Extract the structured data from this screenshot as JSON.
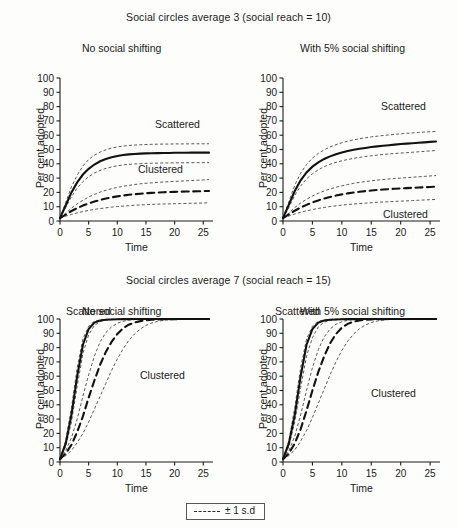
{
  "figure": {
    "sections": [
      {
        "id": "a",
        "title": "Social circles average 3 (social reach = 10)",
        "panels": [
          {
            "subtitle": "No social shifting",
            "scattered_label": "Scattered",
            "clustered_label": "Clustered"
          },
          {
            "subtitle": "With 5% social shifting",
            "scattered_label": "Scattered",
            "clustered_label": "Clustered"
          }
        ]
      },
      {
        "id": "b",
        "title": "Social circles average 7 (social reach = 15)",
        "panels": [
          {
            "subtitle": "No social shifting",
            "scattered_label": "Scattered",
            "clustered_label": "Clustered"
          },
          {
            "subtitle": "With 5% social shifting",
            "scattered_label": "Scattered",
            "clustered_label": "Clustered"
          }
        ]
      }
    ],
    "legend": {
      "label": "± 1 s.d",
      "marker": "dashed-line"
    },
    "axis": {
      "ylabel": "Per cent adopted",
      "xlabel": "Time",
      "yticks": [
        0,
        10,
        20,
        30,
        40,
        50,
        60,
        70,
        80,
        90,
        100
      ],
      "xticks": [
        0,
        5,
        10,
        15,
        20,
        25
      ],
      "ylim": [
        0,
        100
      ],
      "xlim": [
        0,
        26
      ]
    }
  },
  "chart_data": {
    "type": "line",
    "xlabel": "Time",
    "ylabel": "Per cent adopted",
    "xlim": [
      0,
      26
    ],
    "ylim": [
      0,
      100
    ],
    "grid": false,
    "legend": "bottom-center",
    "legend_entries": [
      "± 1 s.d"
    ],
    "x": [
      0,
      1,
      2,
      3,
      4,
      5,
      6,
      7,
      8,
      9,
      10,
      11,
      12,
      13,
      14,
      15,
      16,
      17,
      18,
      19,
      20,
      21,
      22,
      23,
      24,
      25,
      26
    ],
    "panels": [
      {
        "panel": "top-left",
        "section_title": "Social circles average 3 (social reach = 10)",
        "subtitle": "No social shifting",
        "series": [
          {
            "name": "Scattered mean",
            "style": "solid-thick",
            "values": [
              2,
              11,
              20,
              27,
              32.5,
              36.5,
              39.5,
              41.8,
              43.4,
              44.6,
              45.5,
              46.1,
              46.6,
              46.9,
              47.1,
              47.3,
              47.4,
              47.5,
              47.6,
              47.6,
              47.7,
              47.7,
              47.7,
              47.8,
              47.8,
              47.8,
              47.8
            ]
          },
          {
            "name": "Scattered +1 s.d",
            "style": "dotted-thin",
            "values": [
              2,
              13,
              24,
              32,
              38.5,
              43,
              46,
              48.2,
              49.8,
              51,
              51.8,
              52.4,
              52.8,
              53.1,
              53.3,
              53.5,
              53.6,
              53.7,
              53.8,
              53.8,
              53.9,
              53.9,
              53.9,
              54,
              54,
              54,
              54
            ]
          },
          {
            "name": "Scattered -1 s.d",
            "style": "dotted-thin",
            "values": [
              2,
              9.5,
              17,
              23,
              27.5,
              31,
              33.5,
              35.4,
              36.8,
              37.8,
              38.6,
              39.2,
              39.6,
              39.9,
              40.1,
              40.3,
              40.4,
              40.5,
              40.6,
              40.6,
              40.7,
              40.7,
              40.7,
              40.8,
              40.8,
              40.8,
              40.8
            ]
          },
          {
            "name": "Clustered mean",
            "style": "dashed-thick",
            "values": [
              2,
              4.5,
              7,
              9,
              10.8,
              12.3,
              13.6,
              14.7,
              15.7,
              16.5,
              17.2,
              17.8,
              18.3,
              18.7,
              19.1,
              19.4,
              19.7,
              19.9,
              20.1,
              20.3,
              20.4,
              20.5,
              20.6,
              20.7,
              20.8,
              20.9,
              21
            ]
          },
          {
            "name": "Clustered +1 s.d",
            "style": "dotted-thin",
            "values": [
              2,
              5.5,
              9,
              12,
              14.5,
              16.8,
              18.6,
              20.2,
              21.5,
              22.6,
              23.5,
              24.3,
              24.9,
              25.5,
              26,
              26.4,
              26.7,
              27,
              27.3,
              27.5,
              27.7,
              27.9,
              28.1,
              28.3,
              28.5,
              28.7,
              28.9
            ]
          },
          {
            "name": "Clustered -1 s.d",
            "style": "dotted-thin",
            "values": [
              2,
              3.4,
              4.6,
              5.7,
              6.6,
              7.4,
              8.1,
              8.7,
              9.2,
              9.7,
              10.1,
              10.4,
              10.7,
              11,
              11.2,
              11.4,
              11.6,
              11.8,
              11.9,
              12,
              12.1,
              12.2,
              12.3,
              12.4,
              12.5,
              12.6,
              12.7
            ]
          }
        ]
      },
      {
        "panel": "top-right",
        "section_title": "Social circles average 3 (social reach = 10)",
        "subtitle": "With 5% social shifting",
        "series": [
          {
            "name": "Scattered mean",
            "style": "solid-thick",
            "values": [
              2,
              11.5,
              21,
              28.5,
              34,
              38,
              41,
              43.4,
              45.2,
              46.7,
              47.9,
              48.9,
              49.8,
              50.5,
              51.1,
              51.7,
              52.2,
              52.6,
              53,
              53.4,
              53.8,
              54.1,
              54.4,
              54.7,
              55,
              55.3,
              55.6
            ]
          },
          {
            "name": "Scattered +1 s.d",
            "style": "dotted-thin",
            "values": [
              2,
              13.5,
              25,
              33.5,
              39.5,
              44,
              47.3,
              49.8,
              51.8,
              53.4,
              54.7,
              55.8,
              56.7,
              57.5,
              58.2,
              58.8,
              59.3,
              59.8,
              60.2,
              60.6,
              61,
              61.3,
              61.6,
              61.9,
              62.2,
              62.4,
              62.6
            ]
          },
          {
            "name": "Scattered -1 s.d",
            "style": "dotted-thin",
            "values": [
              2,
              9.5,
              18,
              24.5,
              29.5,
              33,
              35.8,
              38,
              39.7,
              41,
              42.1,
              43,
              43.8,
              44.5,
              45.1,
              45.6,
              46.1,
              46.5,
              46.9,
              47.2,
              47.5,
              47.8,
              48.1,
              48.4,
              48.7,
              49,
              49.3
            ]
          },
          {
            "name": "Clustered mean",
            "style": "dashed-thick",
            "values": [
              2,
              4.6,
              7.2,
              9.4,
              11.3,
              13,
              14.4,
              15.7,
              16.8,
              17.8,
              18.6,
              19.3,
              19.9,
              20.4,
              20.9,
              21.3,
              21.7,
              22,
              22.3,
              22.6,
              22.8,
              23,
              23.2,
              23.4,
              23.6,
              23.8,
              24
            ]
          },
          {
            "name": "Clustered +1 s.d",
            "style": "dotted-thin",
            "values": [
              2,
              5.6,
              9.4,
              12.6,
              15.2,
              17.5,
              19.4,
              21,
              22.4,
              23.6,
              24.6,
              25.5,
              26.3,
              27,
              27.6,
              28.1,
              28.6,
              29,
              29.4,
              29.7,
              30,
              30.3,
              30.6,
              30.9,
              31.2,
              31.5,
              31.8
            ]
          },
          {
            "name": "Clustered -1 s.d",
            "style": "dotted-thin",
            "values": [
              2,
              3.5,
              4.9,
              6.1,
              7.1,
              8,
              8.8,
              9.5,
              10.1,
              10.6,
              11.1,
              11.5,
              11.9,
              12.2,
              12.5,
              12.8,
              13.1,
              13.3,
              13.5,
              13.7,
              13.9,
              14.1,
              14.3,
              14.5,
              14.7,
              14.9,
              15.1
            ]
          }
        ]
      },
      {
        "panel": "bottom-left",
        "section_title": "Social circles average 7 (social reach = 15)",
        "subtitle": "No social shifting",
        "series": [
          {
            "name": "Scattered mean",
            "style": "solid-thick",
            "values": [
              2,
              13,
              33,
              60,
              82,
              93,
              97.5,
              99,
              99.5,
              99.7,
              99.8,
              99.9,
              99.9,
              100,
              100,
              100,
              100,
              100,
              100,
              100,
              100,
              100,
              100,
              100,
              100,
              100,
              100
            ]
          },
          {
            "name": "Scattered +1 s.d",
            "style": "dotted-thin",
            "values": [
              2,
              15,
              38,
              66,
              86,
              95,
              98.3,
              99.4,
              99.7,
              99.9,
              99.9,
              100,
              100,
              100,
              100,
              100,
              100,
              100,
              100,
              100,
              100,
              100,
              100,
              100,
              100,
              100,
              100
            ]
          },
          {
            "name": "Scattered -1 s.d",
            "style": "dotted-thin",
            "values": [
              2,
              11,
              28,
              53,
              76,
              89,
              95.5,
              98.2,
              99.2,
              99.6,
              99.8,
              99.9,
              99.9,
              100,
              100,
              100,
              100,
              100,
              100,
              100,
              100,
              100,
              100,
              100,
              100,
              100,
              100
            ]
          },
          {
            "name": "Clustered mean",
            "style": "dashed-thick",
            "values": [
              2,
              6,
              12,
              21,
              32,
              45,
              57,
              68,
              77,
              84,
              89.5,
              93.5,
              96,
              97.5,
              98.5,
              99.1,
              99.5,
              99.7,
              99.8,
              99.9,
              99.9,
              100,
              100,
              100,
              100,
              100,
              100
            ]
          },
          {
            "name": "Clustered +1 s.d",
            "style": "dotted-thin",
            "values": [
              2,
              8,
              17,
              30,
              46,
              61,
              74,
              84,
              90.5,
              94.5,
              97,
              98.4,
              99.2,
              99.6,
              99.8,
              99.9,
              100,
              100,
              100,
              100,
              100,
              100,
              100,
              100,
              100,
              100,
              100
            ]
          },
          {
            "name": "Clustered -1 s.d",
            "style": "dotted-thin",
            "values": [
              2,
              4.5,
              8,
              13.5,
              20,
              28,
              37,
              46,
              55,
              64,
              72,
              79,
              85,
              89.5,
              93,
              95.5,
              97.2,
              98.3,
              99,
              99.4,
              99.6,
              99.8,
              99.9,
              99.9,
              100,
              100,
              100
            ]
          }
        ]
      },
      {
        "panel": "bottom-right",
        "section_title": "Social circles average 7 (social reach = 15)",
        "subtitle": "With 5% social shifting",
        "series": [
          {
            "name": "Scattered mean",
            "style": "solid-thick",
            "values": [
              2,
              13,
              33,
              60,
              82,
              93,
              97.5,
              99,
              99.5,
              99.7,
              99.8,
              99.9,
              99.9,
              100,
              100,
              100,
              100,
              100,
              100,
              100,
              100,
              100,
              100,
              100,
              100,
              100,
              100
            ]
          },
          {
            "name": "Scattered +1 s.d",
            "style": "dotted-thin",
            "values": [
              2,
              15,
              38,
              66,
              86,
              95,
              98.3,
              99.4,
              99.7,
              99.9,
              99.9,
              100,
              100,
              100,
              100,
              100,
              100,
              100,
              100,
              100,
              100,
              100,
              100,
              100,
              100,
              100,
              100
            ]
          },
          {
            "name": "Scattered -1 s.d",
            "style": "dotted-thin",
            "values": [
              2,
              11,
              28,
              52,
              74,
              87,
              94.5,
              97.8,
              99,
              99.5,
              99.8,
              99.9,
              99.9,
              100,
              100,
              100,
              100,
              100,
              100,
              100,
              100,
              100,
              100,
              100,
              100,
              100,
              100
            ]
          },
          {
            "name": "Clustered mean",
            "style": "dashed-thick",
            "values": [
              2,
              6,
              13,
              23,
              36,
              50,
              63,
              74,
              83,
              89.5,
              94,
              96.6,
              98.2,
              99,
              99.5,
              99.7,
              99.9,
              99.9,
              100,
              100,
              100,
              100,
              100,
              100,
              100,
              100,
              100
            ]
          },
          {
            "name": "Clustered +1 s.d",
            "style": "dotted-thin",
            "values": [
              2,
              8,
              18,
              33,
              50,
              66,
              78.5,
              87.5,
              93,
              96.3,
              98.1,
              99.1,
              99.6,
              99.8,
              99.9,
              100,
              100,
              100,
              100,
              100,
              100,
              100,
              100,
              100,
              100,
              100,
              100
            ]
          },
          {
            "name": "Clustered -1 s.d",
            "style": "dotted-thin",
            "values": [
              2,
              4.5,
              8.5,
              14.5,
              22,
              31,
              41,
              51,
              61,
              70,
              78,
              84.5,
              89.5,
              93.2,
              95.8,
              97.5,
              98.6,
              99.2,
              99.6,
              99.8,
              99.9,
              100,
              100,
              100,
              100,
              100,
              100
            ]
          }
        ]
      }
    ]
  }
}
